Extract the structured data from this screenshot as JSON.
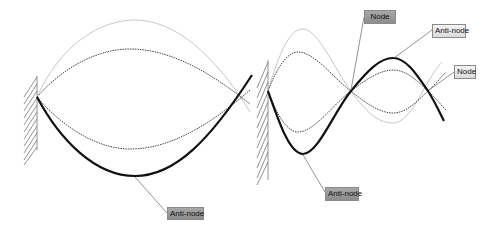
{
  "diagram": {
    "colors": {
      "thick_wave": "#111111",
      "dotted_wave": "#444444",
      "light_wave": "#c8c8c8",
      "wall_hatch": "#777777",
      "leader_line": "#666666",
      "label_dark_bg": "#9a9a9a",
      "label_light_bg": "#e6e6e6"
    },
    "left_panel": {
      "description": "Fundamental mode",
      "labels": [
        {
          "text": "Anti-node",
          "style": "dark"
        }
      ]
    },
    "right_panel": {
      "description": "Third harmonic",
      "labels": [
        {
          "text": "Node",
          "style": "dark"
        },
        {
          "text": "Anti-node",
          "style": "light"
        },
        {
          "text": "Node",
          "style": "light"
        },
        {
          "text": "Anti-node",
          "style": "dark"
        }
      ]
    }
  }
}
